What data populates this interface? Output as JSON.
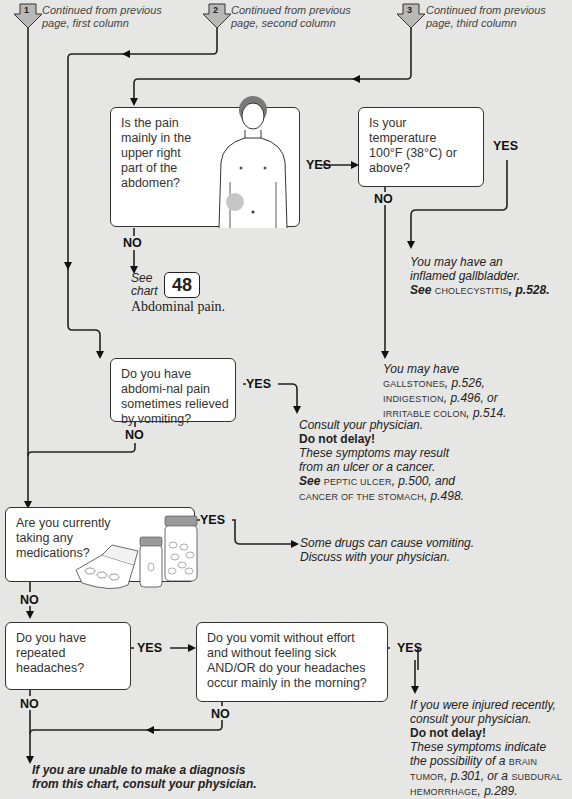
{
  "page_number": "",
  "continuations": [
    {
      "number": "1",
      "text_line1": "Continued from previous",
      "text_line2": "page, first column"
    },
    {
      "number": "2",
      "text_line1": "Continued from previous",
      "text_line2": "page, second column"
    },
    {
      "number": "3",
      "text_line1": "Continued from previous",
      "text_line2": "page, third column"
    }
  ],
  "questions": {
    "q_pain_upper_right": "Is the pain mainly in the upper right part of the abdomen?",
    "q_temperature": "Is your temperature 100°F (38°C) or above?",
    "q_abdominal_pain_vomiting": "Do you have abdomi-nal pain sometimes relieved by vomiting?",
    "q_medications": "Are you currently taking any medications?",
    "q_headaches": "Do you have repeated headaches?",
    "q_vomit_without_effort": "Do you vomit without effort and without feeling sick AND/OR do your headaches occur mainly in the morning?"
  },
  "labels": {
    "yes": "YES",
    "no": "NO"
  },
  "see_chart": {
    "see": "See",
    "chart": "chart",
    "number": "48",
    "title": "Abdominal pain."
  },
  "results": {
    "gallbladder": {
      "line1": "You may have an",
      "line2": "inflamed gallbladder.",
      "see": "See",
      "ref": "CHOLECYSTITIS",
      "page": ", p.528."
    },
    "gallstones": {
      "line1": "You may have",
      "ref1": "GALLSTONES",
      "page1": ", p.526,",
      "ref2": "INDIGESTION",
      "page2": ", p.496, or",
      "ref3": "IRRITABLE COLON",
      "page3": ", p.514."
    },
    "ulcer": {
      "line1": "Consult your physician.",
      "urgent": "Do not delay!",
      "line2": "These symptoms may result",
      "line3": "from an ulcer or a cancer.",
      "see": "See",
      "ref1": "PEPTIC ULCER",
      "page1": ", p.500, and",
      "ref2": "CANCER OF THE STOMACH",
      "page2": ", p.498."
    },
    "drugs": {
      "line1": "Some drugs can cause vomiting.",
      "line2": "Discuss with your physician."
    },
    "brain": {
      "line1": "If you were injured recently,",
      "line2": "consult your physician.",
      "urgent": "Do not delay!",
      "line3": "These symptoms indicate",
      "line4": "the possibility of a",
      "ref1a": "BRAIN",
      "ref1b": "TUMOR",
      "page1": ", p.301, or a",
      "ref2a": "SUBDURAL",
      "ref2b": "HEMORRHAGE",
      "page2": ", p.289."
    },
    "final": {
      "line1": "If you are unable to make a diagnosis",
      "line2": "from this chart, consult your physician."
    }
  },
  "colors": {
    "background": "#e6e6e4",
    "box": "#ffffff",
    "line": "#222222",
    "arrow_badge": "#b8b8b6"
  }
}
